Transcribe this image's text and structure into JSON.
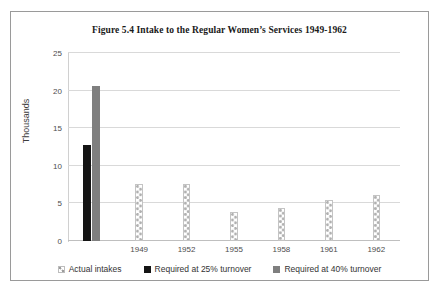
{
  "chart_data": {
    "type": "bar",
    "title": "Figure 5.4 Intake to the Regular Women’s Services 1949-1962",
    "xlabel": "",
    "ylabel": "Thousands",
    "ylim": [
      0,
      25
    ],
    "ytick_labels": [
      "0",
      "5",
      "10",
      "15",
      "20",
      "25"
    ],
    "ytick_values": [
      0,
      5,
      10,
      15,
      20,
      25
    ],
    "grid": true,
    "legend_position": "bottom",
    "categories": [
      "",
      "1949",
      "1952",
      "1955",
      "1958",
      "1961",
      "1962"
    ],
    "xtick_labels": [
      "1949",
      "1952",
      "1955",
      "1958",
      "1961",
      "1962"
    ],
    "series": [
      {
        "name": "Actual intakes",
        "color": "#ffffff",
        "pattern": "dotted-hatch",
        "values": [
          null,
          7.6,
          7.6,
          3.9,
          4.4,
          5.4,
          6.1
        ]
      },
      {
        "name": "Required at 25% turnover",
        "color": "#141414",
        "pattern": "solid",
        "values": [
          12.8,
          null,
          null,
          null,
          null,
          null,
          null
        ]
      },
      {
        "name": "Required at 40% turnover",
        "color": "#7f7f7f",
        "pattern": "solid",
        "values": [
          20.6,
          null,
          null,
          null,
          null,
          null,
          null
        ]
      }
    ]
  },
  "legend": {
    "items": [
      {
        "label": "Actual intakes",
        "swatch": "actual"
      },
      {
        "label": "Required at 25% turnover",
        "swatch": "req25"
      },
      {
        "label": "Required at 40% turnover",
        "swatch": "req40"
      }
    ]
  },
  "colors": {
    "frame_border": "#9a9a9a",
    "gridline": "#d9d9d9",
    "axis_text": "#4d4d4d",
    "title_text": "#1a1a1a"
  }
}
